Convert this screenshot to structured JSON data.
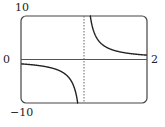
{
  "chart_data": {
    "type": "line",
    "title": "",
    "xlabel": "",
    "ylabel": "",
    "xlim": [
      0,
      2
    ],
    "ylim": [
      -10,
      10
    ],
    "grid": false,
    "legend": null,
    "tick_labels": {
      "y_max": "10",
      "y_min": "−10",
      "x_min": "0",
      "x_max": "2"
    },
    "function": "y = 1/(x - 1)",
    "vertical_asymptote": 1,
    "horizontal_asymptote": 0,
    "series": [
      {
        "name": "left branch",
        "x": [
          0,
          0.2,
          0.4,
          0.6,
          0.7,
          0.8,
          0.85,
          0.9,
          0.95
        ],
        "y": [
          -1,
          -1.25,
          -1.67,
          -2.5,
          -3.33,
          -5,
          -6.67,
          -10,
          -10
        ]
      },
      {
        "name": "right branch",
        "x": [
          1.1,
          1.15,
          1.2,
          1.3,
          1.4,
          1.6,
          1.8,
          2.0
        ],
        "y": [
          10,
          6.67,
          5,
          3.33,
          2.5,
          1.67,
          1.25,
          1
        ]
      }
    ],
    "colors": {
      "curve": "#222222",
      "axis": "#555555",
      "frame": "#444444",
      "asymptote": "#666666"
    }
  }
}
